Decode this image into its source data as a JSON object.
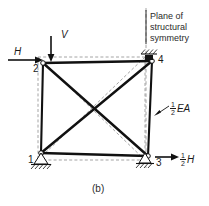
{
  "figure": {
    "caption": "(b)",
    "type": "structural-truss-diagram",
    "symmetry_note": {
      "line1": "Plane of",
      "line2": "structural",
      "line3": "symmetry"
    },
    "member_label": {
      "numerator": "1",
      "denominator": "2",
      "symbol": "EA"
    },
    "reaction_label": {
      "numerator": "1",
      "denominator": "2",
      "symbol": "H"
    },
    "loads": [
      {
        "name": "H",
        "label": "H",
        "direction": "right",
        "applied_at_node": "2"
      },
      {
        "name": "V",
        "label": "V",
        "direction": "down",
        "applied_at_node": "2"
      }
    ],
    "nodes": [
      {
        "id": "1",
        "label": "1",
        "x": 41,
        "y": 153,
        "support": "pin-hatched"
      },
      {
        "id": "2",
        "label": "2",
        "x": 43,
        "y": 63,
        "support": "free"
      },
      {
        "id": "3",
        "label": "3",
        "x": 148,
        "y": 156,
        "support": "pin-hatched"
      },
      {
        "id": "4",
        "label": "4",
        "x": 152,
        "y": 61,
        "support": "fixed-hatched-top"
      }
    ],
    "members": [
      {
        "from": "2",
        "to": "4",
        "kind": "solid"
      },
      {
        "from": "1",
        "to": "3",
        "kind": "solid"
      },
      {
        "from": "1",
        "to": "2",
        "kind": "solid"
      },
      {
        "from": "3",
        "to": "4",
        "kind": "solid"
      },
      {
        "from": "1",
        "to": "4",
        "kind": "solid-diagonal"
      },
      {
        "from": "2",
        "to": "3",
        "kind": "solid-diagonal"
      }
    ],
    "reference_outline": {
      "kind": "dashed-gray",
      "x1": 38,
      "y1": 57,
      "x2": 145,
      "y2": 160
    },
    "colors": {
      "ink": "#1a1a1a",
      "member": "#111111",
      "reference": "#9a9a9a",
      "background": "#ffffff"
    }
  }
}
